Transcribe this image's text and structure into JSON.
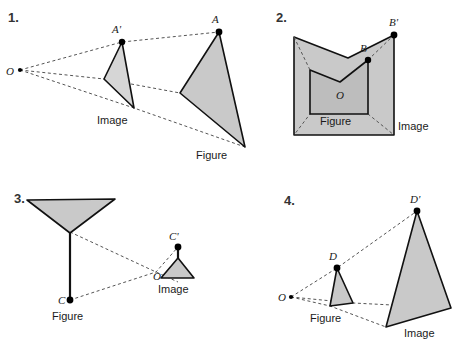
{
  "page": {
    "background_color": "#ffffff",
    "shape_fill_color": "#c9c9c9",
    "ray_color": "#555555",
    "outline_color": "#111111"
  },
  "problems": [
    {
      "number": "1.",
      "center_label": "O",
      "point_labels": [
        "A'",
        "A"
      ],
      "figure_label": "Figure",
      "image_label": "Image",
      "description": "Center O at left; small triangle labeled Image with vertex A-prime; large triangle labeled Figure with vertex A; dashed rays from O through corresponding vertices",
      "reduction": true
    },
    {
      "number": "2.",
      "center_label": "O",
      "point_labels": [
        "B",
        "B'"
      ],
      "figure_label": "Figure",
      "image_label": "Image",
      "description": "Center O inside; small chevron pentagon labeled Figure with vertex B; large chevron pentagon labeled Image with vertex B-prime; dashed rays from O through corresponding vertices",
      "reduction": false
    },
    {
      "number": "3.",
      "center_label": "O",
      "point_labels": [
        "C",
        "C'"
      ],
      "figure_label": "Figure",
      "image_label": "Image",
      "description": "Center O at middle right; large inverted-triangle-with-stem labeled Figure with endpoint C; small inverted-triangle-with-stem labeled Image with endpoint C-prime; dashed rays from O",
      "reduction": true
    },
    {
      "number": "4.",
      "center_label": "O",
      "point_labels": [
        "D",
        "D'"
      ],
      "figure_label": "Figure",
      "image_label": "Image",
      "description": "Center O at left; small triangle labeled Figure with vertex D; large triangle labeled Image with vertex D-prime; dashed rays from O through corresponding vertices",
      "reduction": false
    }
  ]
}
